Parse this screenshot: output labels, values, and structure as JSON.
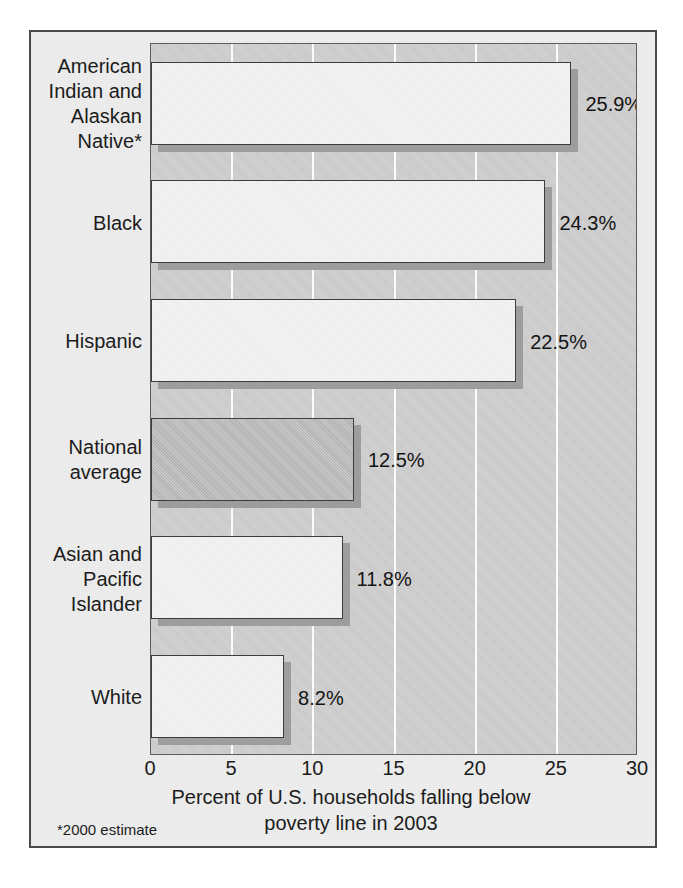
{
  "chart_data": {
    "type": "bar",
    "orientation": "horizontal",
    "title": "",
    "subtitle": "",
    "xlabel": "Percent of U.S. households falling below poverty line in 2003",
    "xlabel_line1": "Percent of U.S. households falling below",
    "xlabel_line2": "poverty line in 2003",
    "ylabel": "",
    "xlim": [
      0,
      30
    ],
    "xticks": [
      0,
      5,
      10,
      15,
      20,
      25,
      30
    ],
    "xtick_labels": [
      "0",
      "5",
      "10",
      "15",
      "20",
      "25",
      "30"
    ],
    "grid": "vertical-white-gridlines",
    "legend": "none",
    "footnote": "*2000 estimate",
    "categories": [
      "American\nIndian and\nAlaskan\nNative*",
      "Black",
      "Hispanic",
      "National\naverage",
      "Asian and\nPacific\nIslander",
      "White"
    ],
    "values": [
      25.9,
      24.3,
      22.5,
      12.5,
      11.8,
      8.2
    ],
    "value_labels": [
      "25.9%",
      "24.3%",
      "22.5%",
      "12.5%",
      "11.8%",
      "8.2%"
    ],
    "bars": [
      {
        "category": "American\nIndian and\nAlaskan\nNative*",
        "value": 25.9,
        "label": "25.9%",
        "highlighted": false
      },
      {
        "category": "Black",
        "value": 24.3,
        "label": "24.3%",
        "highlighted": false
      },
      {
        "category": "Hispanic",
        "value": 22.5,
        "label": "22.5%",
        "highlighted": false
      },
      {
        "category": "National\naverage",
        "value": 12.5,
        "label": "12.5%",
        "highlighted": true
      },
      {
        "category": "Asian and\nPacific\nIslander",
        "value": 11.8,
        "label": "11.8%",
        "highlighted": false
      },
      {
        "category": "White",
        "value": 8.2,
        "label": "8.2%",
        "highlighted": false
      }
    ]
  },
  "colors": {
    "figure_background": "#eeeeee",
    "plot_background": "#c9c9c9",
    "gridline": "#fbfbfb",
    "bar_fill": "#f2f2f2",
    "bar_fill_highlight": "#b9b9b9",
    "bar_outline": "#3d3d3d",
    "bar_shadow": "#9d9d9d",
    "text": "#1c1c1c",
    "frame_border": "#4a4a4a"
  },
  "caption": ""
}
